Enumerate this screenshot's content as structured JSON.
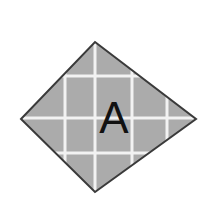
{
  "figure": {
    "kind": "geometry-diagram",
    "background_color": "#ffffff",
    "canvas": {
      "width": 211,
      "height": 221
    },
    "shape": {
      "name": "kite-quadrilateral",
      "label": "A",
      "fill_color": "#ababab",
      "stroke_color": "#3a3a3a",
      "stroke_width": 2,
      "vertices": [
        {
          "name": "top",
          "x": 95,
          "y": 42
        },
        {
          "name": "right",
          "x": 196,
          "y": 119
        },
        {
          "name": "bottom",
          "x": 95,
          "y": 192
        },
        {
          "name": "left",
          "x": 21,
          "y": 119
        }
      ],
      "points_path": "95,42 196,119 95,192 21,119"
    },
    "grid": {
      "line_color": "#f2f2f2",
      "line_width": 3,
      "vertical_x": [
        65,
        95,
        132,
        167
      ],
      "horizontal_y": [
        76,
        118,
        153
      ]
    },
    "label": {
      "text": "A",
      "x": 114,
      "y": 133,
      "font_size": 44,
      "color": "#111111"
    }
  }
}
